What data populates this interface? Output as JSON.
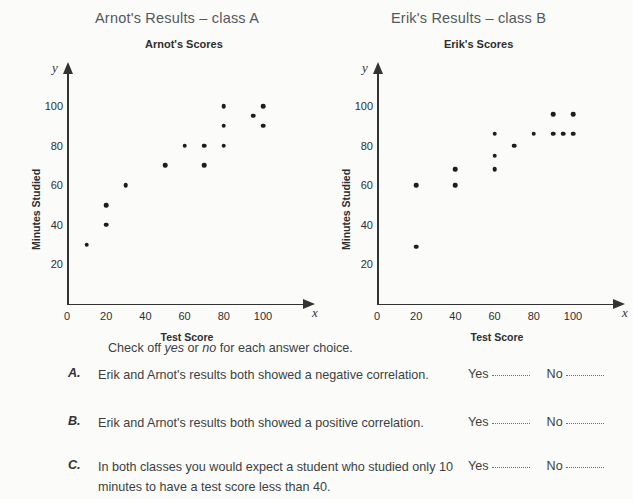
{
  "page": {
    "background": "#fbfbfa",
    "ink": "#3b3f43"
  },
  "sections": {
    "left_title": "Arnot's Results – class A",
    "right_title": "Erik's Results – class B"
  },
  "chart_data": [
    {
      "type": "scatter",
      "title": "Arnot's Scores",
      "xlabel": "Test Score",
      "ylabel": "Minutes Studied",
      "x_var": "x",
      "y_var": "y",
      "xlim": [
        0,
        120
      ],
      "ylim": [
        0,
        110
      ],
      "xticks": [
        0,
        20,
        40,
        60,
        80,
        100
      ],
      "yticks": [
        20,
        40,
        60,
        80,
        100
      ],
      "grid": false,
      "legend": false,
      "points": [
        {
          "x": 10,
          "y": 30
        },
        {
          "x": 20,
          "y": 40
        },
        {
          "x": 20,
          "y": 50
        },
        {
          "x": 30,
          "y": 60
        },
        {
          "x": 50,
          "y": 70
        },
        {
          "x": 60,
          "y": 80
        },
        {
          "x": 70,
          "y": 70
        },
        {
          "x": 70,
          "y": 80
        },
        {
          "x": 80,
          "y": 80
        },
        {
          "x": 80,
          "y": 90
        },
        {
          "x": 80,
          "y": 100
        },
        {
          "x": 95,
          "y": 95
        },
        {
          "x": 100,
          "y": 90
        },
        {
          "x": 100,
          "y": 100
        }
      ]
    },
    {
      "type": "scatter",
      "title": "Erik's Scores",
      "xlabel": "Test Score",
      "ylabel": "Minutes Studied",
      "x_var": "x",
      "y_var": "y",
      "xlim": [
        0,
        120
      ],
      "ylim": [
        0,
        110
      ],
      "xticks": [
        0,
        20,
        40,
        60,
        80,
        100
      ],
      "yticks": [
        20,
        40,
        60,
        80,
        100
      ],
      "grid": false,
      "legend": false,
      "points": [
        {
          "x": 20,
          "y": 29
        },
        {
          "x": 20,
          "y": 60
        },
        {
          "x": 40,
          "y": 60
        },
        {
          "x": 40,
          "y": 68
        },
        {
          "x": 60,
          "y": 68
        },
        {
          "x": 60,
          "y": 75
        },
        {
          "x": 60,
          "y": 86
        },
        {
          "x": 70,
          "y": 80
        },
        {
          "x": 80,
          "y": 86
        },
        {
          "x": 90,
          "y": 86
        },
        {
          "x": 90,
          "y": 96
        },
        {
          "x": 95,
          "y": 86
        },
        {
          "x": 100,
          "y": 86
        },
        {
          "x": 100,
          "y": 96
        }
      ]
    }
  ],
  "question": {
    "intro_before": "Check off ",
    "intro_yes": "yes",
    "intro_mid": " or ",
    "intro_no": "no",
    "intro_after": " for each answer choice.",
    "yes_label": "Yes",
    "no_label": "No",
    "items": [
      {
        "letter": "A.",
        "text": "Erik and Arnot's results both showed a negative correlation."
      },
      {
        "letter": "B.",
        "text": "Erik and Arnot's results both showed a positive correlation."
      },
      {
        "letter": "C.",
        "text": "In both classes you would expect a student who studied only 10 minutes to have a test score less than 40."
      }
    ]
  }
}
